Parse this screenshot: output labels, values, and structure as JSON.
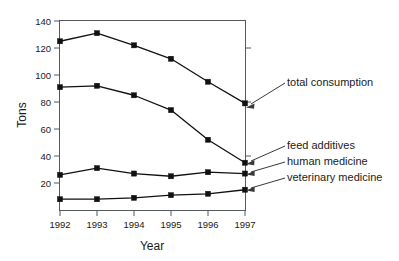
{
  "chart_data": {
    "type": "line",
    "title": "",
    "xlabel": "Year",
    "ylabel": "Tons",
    "categories": [
      "1992",
      "1993",
      "1994",
      "1995",
      "1996",
      "1997"
    ],
    "x": [
      1992,
      1993,
      1994,
      1995,
      1996,
      1997
    ],
    "xlim": [
      1992,
      1997
    ],
    "ylim": [
      0,
      140
    ],
    "yticks": [
      20,
      40,
      60,
      80,
      100,
      120,
      140
    ],
    "ytick_labels": [
      "20",
      "40",
      "60",
      "80",
      "100",
      "120",
      "140"
    ],
    "grid": false,
    "legend_position": "right-annotations",
    "marker": "square",
    "series": [
      {
        "name": "total consumption",
        "values": [
          125,
          131,
          122,
          112,
          95,
          79
        ],
        "annotation": "total consumption"
      },
      {
        "name": "feed additives",
        "values": [
          91,
          92,
          85,
          74,
          52,
          35
        ],
        "annotation": "feed additives"
      },
      {
        "name": "human medicine",
        "values": [
          26,
          31,
          27,
          25,
          28,
          27
        ],
        "annotation": "human medicine"
      },
      {
        "name": "veterinary medicine",
        "values": [
          8,
          8,
          9,
          11,
          12,
          15
        ],
        "annotation": "veterinary medicine"
      }
    ],
    "annotations": [
      {
        "text": "total consumption",
        "points_to_series": "total consumption",
        "points_to_x": 1997
      },
      {
        "text": "feed additives",
        "points_to_series": "feed additives",
        "points_to_x": 1997
      },
      {
        "text": "human medicine",
        "points_to_series": "human medicine",
        "points_to_x": 1997
      },
      {
        "text": "veterinary medicine",
        "points_to_series": "veterinary medicine",
        "points_to_x": 1997
      }
    ]
  },
  "axes": {
    "y_title": "Tons",
    "x_title": "Year",
    "y_tick_0": "140",
    "y_tick_1": "120",
    "y_tick_2": "100",
    "y_tick_3": "80",
    "y_tick_4": "60",
    "y_tick_5": "40",
    "y_tick_6": "20",
    "x_tick_0": "1992",
    "x_tick_1": "1993",
    "x_tick_2": "1994",
    "x_tick_3": "1995",
    "x_tick_4": "1996",
    "x_tick_5": "1997"
  },
  "labels": {
    "total_consumption": "total consumption",
    "feed_additives": "feed additives",
    "human_medicine": "human medicine",
    "veterinary_medicine": "veterinary medicine"
  },
  "colors": {
    "line": "#111111",
    "frame": "#555a5e",
    "text": "#1a1a1a",
    "background": "#ffffff"
  }
}
